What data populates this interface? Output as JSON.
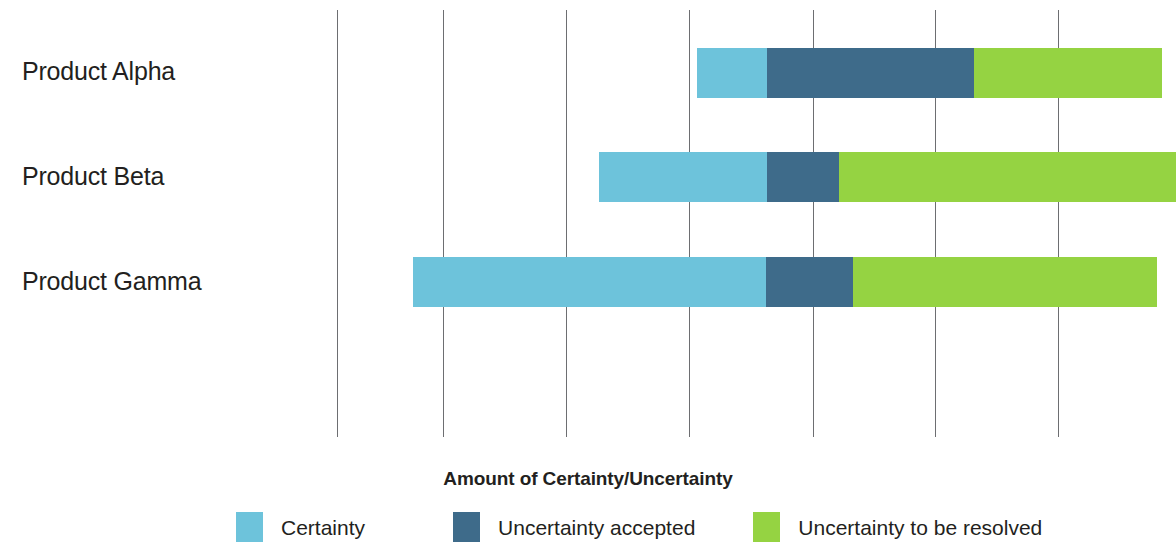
{
  "chart_data": {
    "type": "bar",
    "orientation": "horizontal",
    "stacked": true,
    "title": "",
    "xlabel": "Amount of Certainty/Uncertainty",
    "ylabel": "",
    "categories": [
      "Product Alpha",
      "Product Beta",
      "Product Gamma"
    ],
    "series": [
      {
        "name": "Certainty",
        "color": "#6dc3db",
        "values": [
          70,
          168,
          353
        ]
      },
      {
        "name": "Uncertainty accepted",
        "color": "#3e6b8a",
        "values": [
          207,
          72,
          87
        ]
      },
      {
        "name": "Uncertainty to be resolved",
        "color": "#95d342",
        "values": [
          188,
          337,
          304
        ]
      }
    ],
    "bar_starts": [
      697,
      599,
      413
    ],
    "grid": true,
    "gridline_positions": [
      337,
      443,
      566,
      689,
      813,
      935,
      1058
    ],
    "axis_tick_labels": [],
    "legend_position": "bottom"
  },
  "axis": {
    "title": "Amount of Certainty/Uncertainty"
  },
  "categories": [
    {
      "label": "Product Alpha"
    },
    {
      "label": "Product Beta"
    },
    {
      "label": "Product Gamma"
    }
  ],
  "legend": {
    "items": [
      {
        "label": "Certainty",
        "color": "#6dc3db"
      },
      {
        "label": "Uncertainty accepted",
        "color": "#3e6b8a"
      },
      {
        "label": "Uncertainty to be resolved",
        "color": "#95d342"
      }
    ]
  }
}
